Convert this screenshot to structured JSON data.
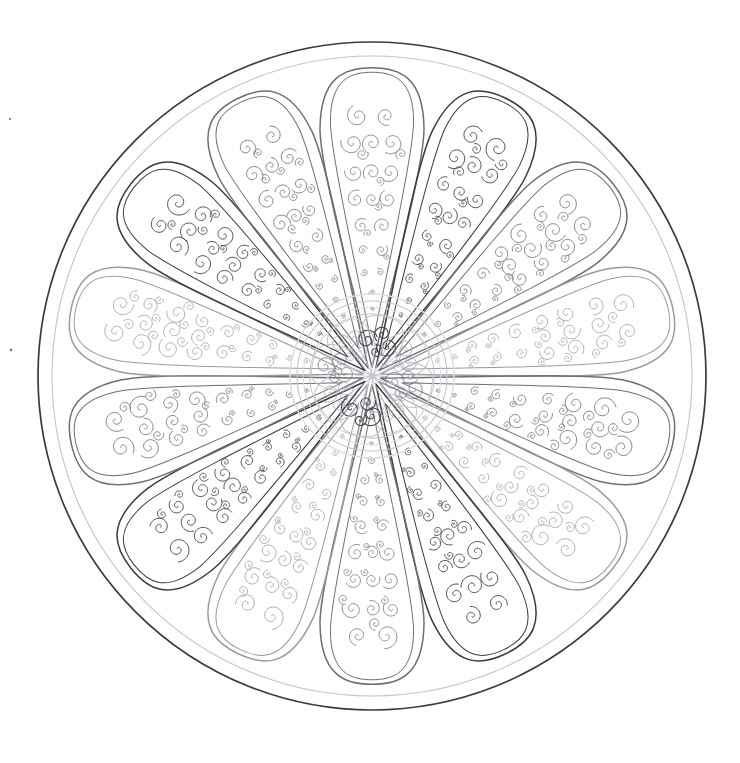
{
  "canvas": {
    "width": 740,
    "height": 763,
    "background": "#ffffff",
    "title": "Floral Mandala Coloring Page"
  },
  "artwork": {
    "type": "mandala",
    "style": "line-art-coloring-page",
    "center_x": 372,
    "center_y": 376,
    "outer_radius": 334,
    "inner_ring_radius": 320,
    "petal_count": 14,
    "core_radius": 82,
    "core_petal_count": 8,
    "description": "Radially symmetric mandala of fourteen teardrop petals filled with spiral scrollwork, enclosed by two concentric circles, with an eight-petal rosette hub at the centre."
  },
  "colors": {
    "background": "#ffffff",
    "outline_dark": "#3a3a40",
    "outline_mid": "#6e6e76",
    "outline_light": "#9a9aa2",
    "outline_faint": "#c4c4cb",
    "outline_ghost": "#dcdce1",
    "swirl_dark": "#4a4a52",
    "swirl_mid": "#7d7d86",
    "swirl_light": "#a9a9b1"
  },
  "strokes": {
    "outer_circle_width": 1.7,
    "inner_circle_width": 1.1,
    "petal_outer_width": 1.5,
    "petal_inner_width": 1.0,
    "swirl_width": 0.85,
    "core_width": 1.0
  },
  "petals": [
    {
      "index": 0,
      "angle_deg": -90,
      "tone": "mid"
    },
    {
      "index": 1,
      "angle_deg": -64.29,
      "tone": "dark"
    },
    {
      "index": 2,
      "angle_deg": -38.57,
      "tone": "mid"
    },
    {
      "index": 3,
      "angle_deg": -12.86,
      "tone": "light"
    },
    {
      "index": 4,
      "angle_deg": 12.86,
      "tone": "mid"
    },
    {
      "index": 5,
      "angle_deg": 38.57,
      "tone": "light"
    },
    {
      "index": 6,
      "angle_deg": 64.29,
      "tone": "dark"
    },
    {
      "index": 7,
      "angle_deg": 90,
      "tone": "mid"
    },
    {
      "index": 8,
      "angle_deg": 115.71,
      "tone": "light"
    },
    {
      "index": 9,
      "angle_deg": 141.43,
      "tone": "dark"
    },
    {
      "index": 10,
      "angle_deg": 167.14,
      "tone": "mid"
    },
    {
      "index": 11,
      "angle_deg": 192.86,
      "tone": "light"
    },
    {
      "index": 12,
      "angle_deg": 218.57,
      "tone": "dark"
    },
    {
      "index": 13,
      "angle_deg": 244.29,
      "tone": "mid"
    }
  ],
  "core_petals": [
    {
      "index": 0,
      "angle_deg": -90,
      "tone": "dark"
    },
    {
      "index": 1,
      "angle_deg": -45,
      "tone": "light"
    },
    {
      "index": 2,
      "angle_deg": 0,
      "tone": "mid"
    },
    {
      "index": 3,
      "angle_deg": 45,
      "tone": "light"
    },
    {
      "index": 4,
      "angle_deg": 90,
      "tone": "dark"
    },
    {
      "index": 5,
      "angle_deg": 135,
      "tone": "light"
    },
    {
      "index": 6,
      "angle_deg": 180,
      "tone": "mid"
    },
    {
      "index": 7,
      "angle_deg": 225,
      "tone": "light"
    }
  ],
  "artifacts": [
    {
      "name": "scan-speck-upper",
      "x": 10,
      "y": 119,
      "r": 1.1
    },
    {
      "name": "scan-speck-lower",
      "x": 11,
      "y": 350,
      "r": 1.3
    }
  ]
}
